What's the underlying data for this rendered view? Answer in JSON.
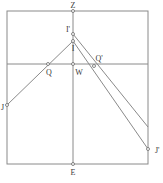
{
  "diagram": {
    "type": "geometric-optics-construction",
    "frame": {
      "left": 7,
      "top": 11,
      "right": 148,
      "bottom": 164
    },
    "horizontal_line_y": 64,
    "vertical_line_x": 73,
    "points": {
      "Z": {
        "label": "Z",
        "x": 73,
        "y": 11
      },
      "I_prime": {
        "label": "I'",
        "x": 73,
        "y": 34
      },
      "I": {
        "label": "I",
        "x": 73,
        "y": 41
      },
      "W": {
        "label": "W",
        "x": 73,
        "y": 64
      },
      "Q": {
        "label": "Q",
        "x": 48,
        "y": 64
      },
      "Q_prime": {
        "label": "Q'",
        "x": 94,
        "y": 64
      },
      "J": {
        "label": "J",
        "x": 7,
        "y": 105
      },
      "J_prime": {
        "label": "J'",
        "x": 148,
        "y": 149
      },
      "E": {
        "label": "E",
        "x": 73,
        "y": 164
      }
    },
    "segments": [
      {
        "from": "J",
        "to": "I"
      },
      {
        "from": "I",
        "to": "J'"
      },
      {
        "from": "I'",
        "to": "right-edge",
        "end": {
          "x": 148,
          "y": 127
        }
      },
      {
        "from": "Z",
        "to": "E"
      },
      {
        "from": "left-edge",
        "to": "right-edge",
        "y": 64
      }
    ]
  }
}
